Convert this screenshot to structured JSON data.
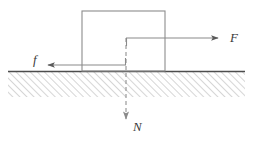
{
  "figure": {
    "type": "physics-force-diagram",
    "canvas": {
      "width": 253,
      "height": 144,
      "background": "#ffffff"
    },
    "colors": {
      "outline": "#8c8c8c",
      "arrow": "#5a5a5a",
      "dashed": "#9a9a9a",
      "ground_line": "#4d4d4d",
      "hatch": "#b4b4b4",
      "label": "#3a3a3a"
    }
  },
  "block": {
    "name": "block",
    "x": 82,
    "y": 11,
    "width": 83,
    "height": 60,
    "stroke": "#8c8c8c",
    "fill": "none"
  },
  "ground": {
    "name": "ground-surface",
    "x": 8,
    "y": 71,
    "width": 237,
    "height": 26,
    "surface_line_color": "#4d4d4d",
    "hatch_color": "#b4b4b4",
    "hatch_direction": "up-right",
    "hatch_spacing": 5
  },
  "forces": [
    {
      "id": "applied",
      "label": "F",
      "description": "applied force",
      "direction": "right",
      "style": "solid",
      "start_x": 126,
      "start_y": 38,
      "end_x": 222,
      "end_y": 38,
      "label_x": 230,
      "label_y": 42,
      "has_origin_stub": true,
      "stub_from_y": 46
    },
    {
      "id": "friction",
      "label": "f",
      "description": "friction force",
      "direction": "left",
      "style": "solid",
      "start_x": 126,
      "start_y": 65,
      "end_x": 44,
      "end_y": 65,
      "label_x": 33,
      "label_y": 64,
      "has_origin_stub": true,
      "stub_from_y": 58
    },
    {
      "id": "normal",
      "label": "N",
      "description": "normal reaction force",
      "direction": "down",
      "style": "dashed",
      "start_x": 126,
      "start_y": 38,
      "end_x": 126,
      "end_y": 123,
      "label_x": 133,
      "label_y": 131
    }
  ]
}
